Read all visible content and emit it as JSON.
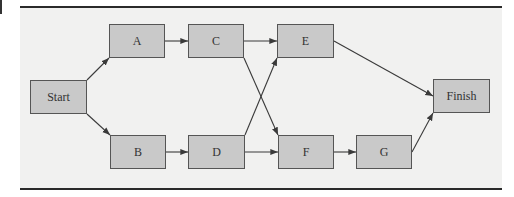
{
  "diagram": {
    "type": "activity-network",
    "nodes": [
      {
        "id": "start",
        "label": "Start",
        "x": 30,
        "y": 80,
        "w": 57,
        "h": 34
      },
      {
        "id": "a",
        "label": "A",
        "x": 109,
        "y": 24,
        "w": 56,
        "h": 34
      },
      {
        "id": "b",
        "label": "B",
        "x": 110,
        "y": 135,
        "w": 56,
        "h": 34
      },
      {
        "id": "c",
        "label": "C",
        "x": 188,
        "y": 24,
        "w": 56,
        "h": 34
      },
      {
        "id": "d",
        "label": "D",
        "x": 188,
        "y": 135,
        "w": 57,
        "h": 34
      },
      {
        "id": "e",
        "label": "E",
        "x": 277,
        "y": 24,
        "w": 57,
        "h": 34
      },
      {
        "id": "f",
        "label": "F",
        "x": 278,
        "y": 135,
        "w": 56,
        "h": 34
      },
      {
        "id": "g",
        "label": "G",
        "x": 356,
        "y": 135,
        "w": 56,
        "h": 34
      },
      {
        "id": "finish",
        "label": "Finish",
        "x": 433,
        "y": 79,
        "w": 57,
        "h": 34
      }
    ],
    "edges": [
      {
        "from": "Start",
        "to": "A"
      },
      {
        "from": "Start",
        "to": "B"
      },
      {
        "from": "A",
        "to": "C"
      },
      {
        "from": "B",
        "to": "D"
      },
      {
        "from": "C",
        "to": "E"
      },
      {
        "from": "C",
        "to": "F"
      },
      {
        "from": "D",
        "to": "E"
      },
      {
        "from": "D",
        "to": "F"
      },
      {
        "from": "E",
        "to": "Finish"
      },
      {
        "from": "F",
        "to": "G"
      },
      {
        "from": "G",
        "to": "Finish"
      }
    ],
    "colors": {
      "node_fill": "#c9c9c9",
      "node_border": "#555555",
      "panel_bg": "#f1f1f0",
      "rule": "#2a2a2a",
      "edge": "#3a3a3a"
    }
  }
}
